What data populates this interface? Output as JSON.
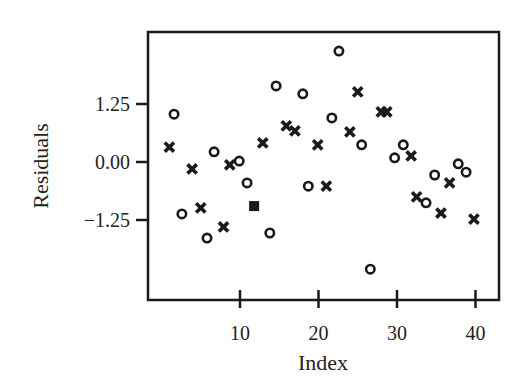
{
  "chart_data": {
    "type": "scatter",
    "title": "",
    "xlabel": "Index",
    "ylabel": "Residuals",
    "xlim": [
      -1.7,
      43
    ],
    "ylim": [
      -2.95,
      2.8
    ],
    "xticks": [
      10,
      20,
      30,
      40
    ],
    "xtick_labels": [
      "10",
      "20",
      "30",
      "40"
    ],
    "yticks": [
      1.25,
      0.0,
      -1.25
    ],
    "ytick_labels": [
      "1.25",
      "0.00",
      "−1.25"
    ],
    "grid": false,
    "legend": null,
    "series": [
      {
        "name": "circle",
        "marker": "o",
        "points": [
          [
            1.6,
            1.03
          ],
          [
            2.6,
            -1.12
          ],
          [
            5.8,
            -1.64
          ],
          [
            6.7,
            0.22
          ],
          [
            9.9,
            0.02
          ],
          [
            10.9,
            -0.45
          ],
          [
            13.8,
            -1.53
          ],
          [
            14.6,
            1.64
          ],
          [
            18.0,
            1.47
          ],
          [
            18.7,
            -0.52
          ],
          [
            21.7,
            0.95
          ],
          [
            22.6,
            2.39
          ],
          [
            25.5,
            0.37
          ],
          [
            26.6,
            -2.31
          ],
          [
            29.7,
            0.09
          ],
          [
            30.8,
            0.37
          ],
          [
            33.7,
            -0.88
          ],
          [
            34.8,
            -0.28
          ],
          [
            37.8,
            -0.04
          ],
          [
            38.8,
            -0.22
          ]
        ]
      },
      {
        "name": "cross",
        "marker": "x",
        "points": [
          [
            1.0,
            0.32
          ],
          [
            3.9,
            -0.15
          ],
          [
            5.0,
            -0.99
          ],
          [
            7.9,
            -1.4
          ],
          [
            8.7,
            -0.06
          ],
          [
            12.9,
            0.41
          ],
          [
            15.9,
            0.78
          ],
          [
            17.0,
            0.67
          ],
          [
            19.9,
            0.37
          ],
          [
            21.0,
            -0.52
          ],
          [
            24.0,
            0.65
          ],
          [
            25.0,
            1.51
          ],
          [
            28.0,
            1.08
          ],
          [
            28.7,
            1.08
          ],
          [
            31.8,
            0.13
          ],
          [
            32.5,
            -0.75
          ],
          [
            35.6,
            -1.1
          ],
          [
            36.7,
            -0.45
          ],
          [
            39.8,
            -1.23
          ]
        ]
      },
      {
        "name": "square",
        "marker": "s",
        "points": [
          [
            11.8,
            -0.95
          ]
        ]
      }
    ]
  },
  "colors": {
    "ink": "#1a1a1a",
    "background": "#ffffff"
  }
}
